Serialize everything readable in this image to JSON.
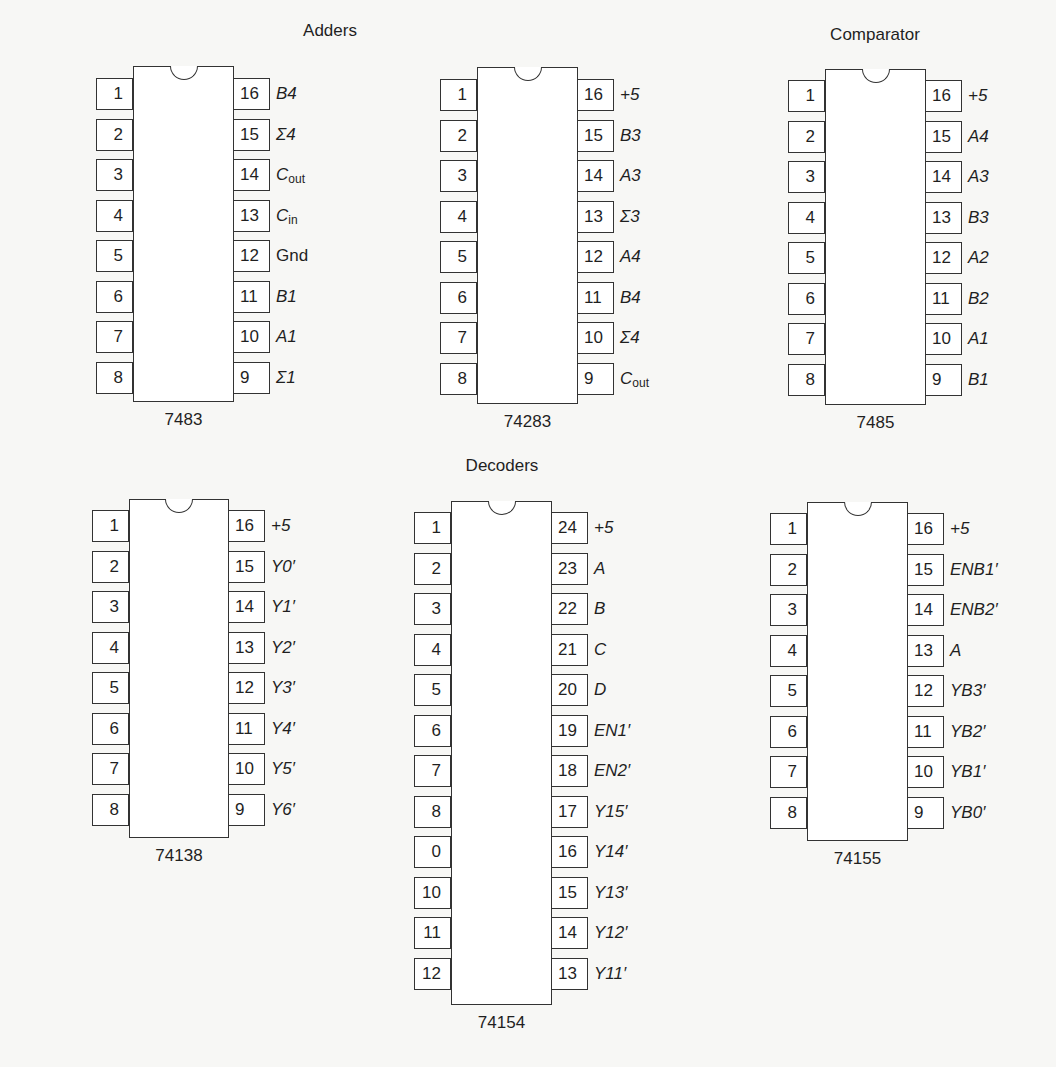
{
  "groups": [
    {
      "title": "Adders",
      "x": 330,
      "y": 32
    },
    {
      "title": "Comparator",
      "x": 875,
      "y": 36
    },
    {
      "title": "Decoders",
      "x": 502,
      "y": 467
    }
  ],
  "chips": [
    {
      "part": "7483",
      "group": "Adders",
      "body": {
        "x": 133,
        "y": 66,
        "w": 101,
        "h": 336
      },
      "pin_top": 78,
      "pitch": 40.5,
      "left": [
        {
          "pin": "1",
          "signal": "A4"
        },
        {
          "pin": "2",
          "signal": "Σ3"
        },
        {
          "pin": "3",
          "signal": "A3"
        },
        {
          "pin": "4",
          "signal": "B3"
        },
        {
          "pin": "5",
          "signal": "+5"
        },
        {
          "pin": "6",
          "signal": "Σ2"
        },
        {
          "pin": "7",
          "signal": "B2"
        },
        {
          "pin": "8",
          "signal": "A2"
        }
      ],
      "right": [
        {
          "pin": "16",
          "signal": "B4"
        },
        {
          "pin": "15",
          "signal": "Σ4"
        },
        {
          "pin": "14",
          "signal": "C",
          "sub": "out"
        },
        {
          "pin": "13",
          "signal": "C",
          "sub": "in"
        },
        {
          "pin": "12",
          "signal": "Gnd",
          "upright": true
        },
        {
          "pin": "11",
          "signal": "B1"
        },
        {
          "pin": "10",
          "signal": "A1"
        },
        {
          "pin": "9",
          "signal": "Σ1"
        }
      ]
    },
    {
      "part": "74283",
      "group": "Adders",
      "body": {
        "x": 477,
        "y": 67,
        "w": 101,
        "h": 337
      },
      "pin_top": 79,
      "pitch": 40.5,
      "left": [
        {
          "pin": "1",
          "signal": "Σ2"
        },
        {
          "pin": "2",
          "signal": "B2"
        },
        {
          "pin": "3",
          "signal": "A2"
        },
        {
          "pin": "4",
          "signal": "Σ1"
        },
        {
          "pin": "5",
          "signal": "A1"
        },
        {
          "pin": "6",
          "signal": "B1"
        },
        {
          "pin": "7",
          "signal": "C",
          "sub": "in"
        },
        {
          "pin": "8",
          "signal": "Gnd",
          "upright": true
        }
      ],
      "right": [
        {
          "pin": "16",
          "signal": "+5"
        },
        {
          "pin": "15",
          "signal": "B3"
        },
        {
          "pin": "14",
          "signal": "A3"
        },
        {
          "pin": "13",
          "signal": "Σ3"
        },
        {
          "pin": "12",
          "signal": "A4"
        },
        {
          "pin": "11",
          "signal": "B4"
        },
        {
          "pin": "10",
          "signal": "Σ4"
        },
        {
          "pin": "9",
          "signal": "C",
          "sub": "out"
        }
      ]
    },
    {
      "part": "7485",
      "group": "Comparator",
      "body": {
        "x": 825,
        "y": 69,
        "w": 101,
        "h": 336
      },
      "pin_top": 80,
      "pitch": 40.5,
      "left": [
        {
          "pin": "1",
          "signal": "B4"
        },
        {
          "pin": "2",
          "signal": "INA<B"
        },
        {
          "pin": "3",
          "signal": "INA=B"
        },
        {
          "pin": "4",
          "signal": "INA>B"
        },
        {
          "pin": "5",
          "signal": "OUTA>B"
        },
        {
          "pin": "6",
          "signal": "OUTA=B"
        },
        {
          "pin": "7",
          "signal": "OUTA<B"
        },
        {
          "pin": "8",
          "signal": "Gnd",
          "upright": true
        }
      ],
      "right": [
        {
          "pin": "16",
          "signal": "+5"
        },
        {
          "pin": "15",
          "signal": "A4"
        },
        {
          "pin": "14",
          "signal": "A3"
        },
        {
          "pin": "13",
          "signal": "B3"
        },
        {
          "pin": "12",
          "signal": "A2"
        },
        {
          "pin": "11",
          "signal": "B2"
        },
        {
          "pin": "10",
          "signal": "A1"
        },
        {
          "pin": "9",
          "signal": "B1"
        }
      ]
    },
    {
      "part": "74138",
      "group": "Decoders",
      "body": {
        "x": 129,
        "y": 499,
        "w": 100,
        "h": 339
      },
      "pin_top": 510,
      "pitch": 40.5,
      "left": [
        {
          "pin": "1",
          "signal": "A"
        },
        {
          "pin": "2",
          "signal": "B"
        },
        {
          "pin": "3",
          "signal": "C"
        },
        {
          "pin": "4",
          "signal": "EN3′"
        },
        {
          "pin": "5",
          "signal": "EN2′"
        },
        {
          "pin": "6",
          "signal": "EN1"
        },
        {
          "pin": "7",
          "signal": "Y7′"
        },
        {
          "pin": "8",
          "signal": "Gnd",
          "upright": true
        }
      ],
      "right": [
        {
          "pin": "16",
          "signal": "+5"
        },
        {
          "pin": "15",
          "signal": "Y0′"
        },
        {
          "pin": "14",
          "signal": "Y1′"
        },
        {
          "pin": "13",
          "signal": "Y2′"
        },
        {
          "pin": "12",
          "signal": "Y3′"
        },
        {
          "pin": "11",
          "signal": "Y4′"
        },
        {
          "pin": "10",
          "signal": "Y5′"
        },
        {
          "pin": "9",
          "signal": "Y6′"
        }
      ]
    },
    {
      "part": "74154",
      "group": "Decoders",
      "body": {
        "x": 451,
        "y": 501,
        "w": 101,
        "h": 504
      },
      "pin_top": 512,
      "pitch": 40.5,
      "left": [
        {
          "pin": "1",
          "signal": "Y0′"
        },
        {
          "pin": "2",
          "signal": "Y1′"
        },
        {
          "pin": "3",
          "signal": "Y2′"
        },
        {
          "pin": "4",
          "signal": "Y3′"
        },
        {
          "pin": "5",
          "signal": "Y4′"
        },
        {
          "pin": "6",
          "signal": "Y5′"
        },
        {
          "pin": "7",
          "signal": "Y6′"
        },
        {
          "pin": "8",
          "signal": "Y7′"
        },
        {
          "pin": "0",
          "signal": "Y8′"
        },
        {
          "pin": "10",
          "signal": "Y9′"
        },
        {
          "pin": "11",
          "signal": "Y10′"
        },
        {
          "pin": "12",
          "signal": "Gnd",
          "upright": true
        }
      ],
      "right": [
        {
          "pin": "24",
          "signal": "+5"
        },
        {
          "pin": "23",
          "signal": "A"
        },
        {
          "pin": "22",
          "signal": "B"
        },
        {
          "pin": "21",
          "signal": "C"
        },
        {
          "pin": "20",
          "signal": "D"
        },
        {
          "pin": "19",
          "signal": "EN1′"
        },
        {
          "pin": "18",
          "signal": "EN2′"
        },
        {
          "pin": "17",
          "signal": "Y15′"
        },
        {
          "pin": "16",
          "signal": "Y14′"
        },
        {
          "pin": "15",
          "signal": "Y13′"
        },
        {
          "pin": "14",
          "signal": "Y12′"
        },
        {
          "pin": "13",
          "signal": "Y11′"
        }
      ]
    },
    {
      "part": "74155",
      "group": "Decoders",
      "body": {
        "x": 807,
        "y": 502,
        "w": 101,
        "h": 339
      },
      "pin_top": 513,
      "pitch": 40.5,
      "left": [
        {
          "pin": "1",
          "signal": "ENA1"
        },
        {
          "pin": "2",
          "signal": "ENA2′"
        },
        {
          "pin": "3",
          "signal": "B"
        },
        {
          "pin": "4",
          "signal": "YA3′"
        },
        {
          "pin": "5",
          "signal": "YA2′"
        },
        {
          "pin": "6",
          "signal": "YA1′"
        },
        {
          "pin": "7",
          "signal": "YA0′"
        },
        {
          "pin": "8",
          "signal": "Gnd",
          "upright": true
        }
      ],
      "right": [
        {
          "pin": "16",
          "signal": "+5"
        },
        {
          "pin": "15",
          "signal": "ENB1′"
        },
        {
          "pin": "14",
          "signal": "ENB2′"
        },
        {
          "pin": "13",
          "signal": "A"
        },
        {
          "pin": "12",
          "signal": "YB3′"
        },
        {
          "pin": "11",
          "signal": "YB2′"
        },
        {
          "pin": "10",
          "signal": "YB1′"
        },
        {
          "pin": "9",
          "signal": "YB0′"
        }
      ]
    }
  ]
}
